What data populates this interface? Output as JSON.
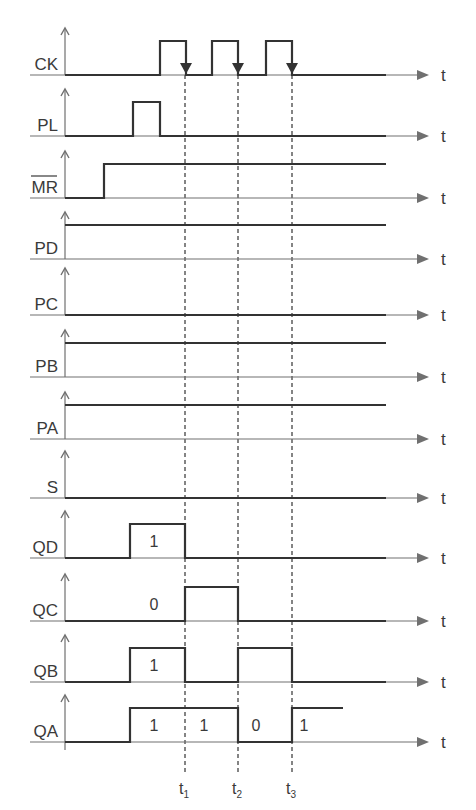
{
  "diagram": {
    "title": "",
    "axis_label": "t",
    "colors": {
      "signal": "#333333",
      "axis": "#707070",
      "dashed": "#666666",
      "text": "#3a3a3a"
    },
    "geometry": {
      "axis_x": 65,
      "axis_end_x": 426,
      "t_label_x": 445,
      "signal_end_x": 386,
      "level_height": 34
    },
    "time_markers": [
      {
        "label": "t",
        "sub": "1",
        "x": 185
      },
      {
        "label": "t",
        "sub": "2",
        "x": 238
      },
      {
        "label": "t",
        "sub": "3",
        "x": 292
      }
    ],
    "signals": [
      {
        "name": "CK",
        "overline": false,
        "baseline": 75,
        "edges": [
          [
            65,
            0
          ],
          [
            160,
            1
          ],
          [
            186,
            0
          ],
          [
            212,
            1
          ],
          [
            238,
            0
          ],
          [
            266,
            1
          ],
          [
            292,
            0
          ],
          [
            386,
            0
          ]
        ],
        "clock_arrows": [
          186,
          238,
          292
        ],
        "bits": []
      },
      {
        "name": "PL",
        "overline": false,
        "baseline": 136,
        "edges": [
          [
            65,
            0
          ],
          [
            133,
            1
          ],
          [
            160,
            0
          ],
          [
            386,
            0
          ]
        ],
        "bits": []
      },
      {
        "name": "MR",
        "overline": true,
        "baseline": 198,
        "edges": [
          [
            65,
            0
          ],
          [
            104,
            1
          ],
          [
            386,
            1
          ]
        ],
        "bits": []
      },
      {
        "name": "PD",
        "overline": false,
        "baseline": 259,
        "edges": [
          [
            65,
            1
          ],
          [
            386,
            1
          ]
        ],
        "bits": []
      },
      {
        "name": "PC",
        "overline": false,
        "baseline": 315,
        "edges": [
          [
            65,
            0
          ],
          [
            386,
            0
          ]
        ],
        "bits": []
      },
      {
        "name": "PB",
        "overline": false,
        "baseline": 377,
        "edges": [
          [
            65,
            1
          ],
          [
            386,
            1
          ]
        ],
        "bits": []
      },
      {
        "name": "PA",
        "overline": false,
        "baseline": 439,
        "edges": [
          [
            65,
            1
          ],
          [
            386,
            1
          ]
        ],
        "bits": []
      },
      {
        "name": "S",
        "overline": false,
        "baseline": 498,
        "edges": [
          [
            65,
            0
          ],
          [
            386,
            0
          ]
        ],
        "bits": []
      },
      {
        "name": "QD",
        "overline": false,
        "baseline": 558,
        "edges": [
          [
            65,
            0
          ],
          [
            130,
            1
          ],
          [
            185,
            0
          ],
          [
            386,
            0
          ]
        ],
        "bits": [
          {
            "text": "1",
            "x": 154
          }
        ]
      },
      {
        "name": "QC",
        "overline": false,
        "baseline": 621,
        "edges": [
          [
            65,
            0
          ],
          [
            185,
            1
          ],
          [
            238,
            0
          ],
          [
            386,
            0
          ]
        ],
        "bits": [
          {
            "text": "0",
            "x": 154
          }
        ]
      },
      {
        "name": "QB",
        "overline": false,
        "baseline": 682,
        "edges": [
          [
            65,
            0
          ],
          [
            130,
            1
          ],
          [
            185,
            0
          ],
          [
            238,
            1
          ],
          [
            292,
            0
          ],
          [
            386,
            0
          ]
        ],
        "bits": [
          {
            "text": "1",
            "x": 154
          }
        ]
      },
      {
        "name": "QA",
        "overline": false,
        "baseline": 742,
        "edges": [
          [
            65,
            0
          ],
          [
            130,
            1
          ],
          [
            238,
            0
          ],
          [
            292,
            1
          ],
          [
            343,
            1
          ]
        ],
        "bits": [
          {
            "text": "1",
            "x": 154
          },
          {
            "text": "1",
            "x": 204
          },
          {
            "text": "0",
            "x": 256
          },
          {
            "text": "1",
            "x": 304
          }
        ]
      }
    ]
  }
}
